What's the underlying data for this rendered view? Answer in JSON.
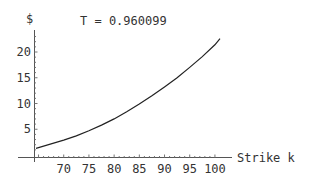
{
  "chart_data": {
    "type": "line",
    "title": "T = 0.960099",
    "xlabel": "Strike k",
    "ylabel": "$",
    "xlim": [
      64.2,
      101
    ],
    "ylim": [
      0,
      24
    ],
    "x_ticks": [
      70,
      75,
      80,
      85,
      90,
      95,
      100
    ],
    "y_ticks": [
      5,
      10,
      15,
      20
    ],
    "grid": false,
    "series": [
      {
        "name": "price",
        "x": [
          64.5,
          67,
          70,
          72.5,
          75,
          77.5,
          80,
          82.5,
          85,
          87.5,
          90,
          92.5,
          95,
          97.5,
          100,
          101
        ],
        "y": [
          1.3,
          2.0,
          2.9,
          3.7,
          4.7,
          5.8,
          7.0,
          8.4,
          9.9,
          11.5,
          13.2,
          15.0,
          17.0,
          19.1,
          21.4,
          22.6
        ]
      }
    ]
  }
}
